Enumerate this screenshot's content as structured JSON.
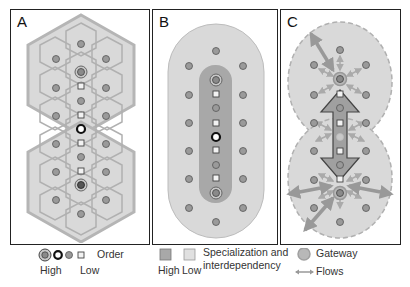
{
  "panels": [
    {
      "id": "A",
      "label": "A",
      "description": "Hexagonal central place lattice with nested hexagonal market areas; high-order centers along the central axis"
    },
    {
      "id": "B",
      "label": "B",
      "description": "Elongated capsule region with darker inner corridor of high specialization and interdependency"
    },
    {
      "id": "C",
      "label": "C",
      "description": "Two overlapping dashed circular regions linked by a large double-headed arrow between gateway nodes with flows"
    }
  ],
  "legend": {
    "order": {
      "title": "Order",
      "high_label": "High",
      "low_label": "Low"
    },
    "specialization": {
      "title_line1": "Specialization and",
      "title_line2": "interdependency",
      "high_label": "High",
      "low_label": "Low"
    },
    "gateway": {
      "label": "Gateway"
    },
    "flows": {
      "label": "Flows"
    }
  },
  "colors": {
    "panel_border": "#222222",
    "region_fill": "#d9d9d9",
    "region_stroke": "#b5b5b5",
    "hex_stroke": "#b0b0b0",
    "corridor_fill": "#a8a8a8",
    "node_fill": "#9a9a9a",
    "node_stroke": "#555555",
    "flow_arrow": "#999999",
    "gateway_ring": "#a0a0a0"
  }
}
